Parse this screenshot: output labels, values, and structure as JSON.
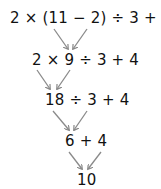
{
  "diagram": {
    "steps": [
      {
        "expression": "2 × (11 − 2) ÷ 3 + 4"
      },
      {
        "expression": "2 × 9 ÷ 3 + 4"
      },
      {
        "expression": "18 ÷ 3 + 4"
      },
      {
        "expression": "6 + 4"
      },
      {
        "expression": "10"
      }
    ],
    "arrow_color": "#8a8a8a",
    "text_color": "#111111"
  }
}
